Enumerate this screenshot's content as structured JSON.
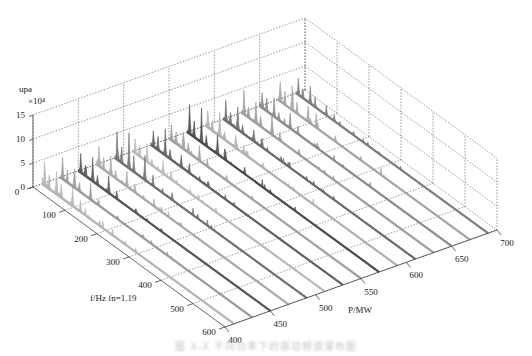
{
  "chart_data": {
    "type": "waterfall-3d",
    "title": "",
    "zlabel": "upa",
    "z_exponent_label": "×10⁴",
    "z_ticks": [
      0,
      5,
      10,
      15
    ],
    "zlim": [
      0,
      15
    ],
    "xlabel": "f/Hz fn=1.19",
    "x_ticks": [
      0,
      100,
      200,
      300,
      400,
      500,
      600
    ],
    "xlim": [
      0,
      600
    ],
    "ylabel": "P/MW",
    "y_ticks": [
      400,
      450,
      500,
      550,
      600,
      650,
      700
    ],
    "ylim": [
      400,
      700
    ],
    "grid": true,
    "series_power_levels": [
      410,
      430,
      450,
      470,
      490,
      510,
      530,
      550,
      570,
      590,
      610,
      630,
      650,
      670,
      690
    ],
    "series_shades": [
      "#b4b4b4",
      "#9a9a9a",
      "#555555",
      "#a8a8a8",
      "#707070",
      "#b8b8b8",
      "#606060",
      "#a0a0a0",
      "#4a4a4a",
      "#b0b0b0",
      "#6a6a6a",
      "#9c9c9c",
      "#8a8a8a",
      "#a4a4a4",
      "#7c7c7c"
    ],
    "peak_profile_note": "Each trace: tall low-frequency peaks (up to ~7-8 ×10^4) near f≈0-120 Hz decaying to low noise floor by f≈600 Hz",
    "peaks": [
      {
        "f": 8,
        "amp": 6.5
      },
      {
        "f": 22,
        "amp": 4.0
      },
      {
        "f": 45,
        "amp": 7.5
      },
      {
        "f": 60,
        "amp": 3.0
      },
      {
        "f": 95,
        "amp": 5.0
      },
      {
        "f": 120,
        "amp": 2.5
      },
      {
        "f": 180,
        "amp": 1.5
      },
      {
        "f": 260,
        "amp": 0.9
      }
    ]
  },
  "caption": "图 X-X 不同功率下的振动频谱瀑布图"
}
